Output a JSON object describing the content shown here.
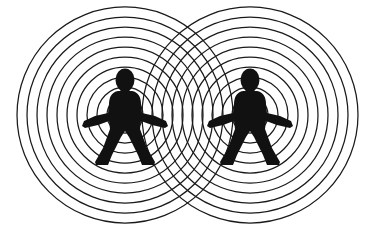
{
  "canvas": {
    "width": 375,
    "height": 241,
    "background_color": "#ffffff",
    "ink_color": "#1a1a1a"
  },
  "illustration": {
    "title": "Two-source concentric wave interference with human figures",
    "type": "line-art-diagram",
    "subject": "two people emitting concentric circular waves that overlap in the middle"
  },
  "wave_sources": [
    {
      "id": "left-source",
      "label": "left wave source",
      "center_x": 125,
      "center_y": 115,
      "ring_count": 10,
      "inner_radius": 18,
      "ring_spacing": 10,
      "outer_radius": 108,
      "stroke_color": "#1a1a1a",
      "stroke_width": 1.25
    },
    {
      "id": "right-source",
      "label": "right wave source",
      "center_x": 250,
      "center_y": 115,
      "ring_count": 10,
      "inner_radius": 18,
      "ring_spacing": 10,
      "outer_radius": 108,
      "stroke_color": "#1a1a1a",
      "stroke_width": 1.25
    }
  ],
  "figures": [
    {
      "id": "left-figure",
      "label": "left human silhouette",
      "center_x": 125,
      "center_y": 117,
      "height": 96,
      "fill_color": "#111111"
    },
    {
      "id": "right-figure",
      "label": "right human silhouette",
      "center_x": 250,
      "center_y": 117,
      "height": 96,
      "fill_color": "#111111"
    }
  ],
  "interference_zone": {
    "label": "overlap region",
    "x_start": 142,
    "x_end": 233,
    "description": "cross-hatched moire pattern where the two ring families intersect"
  }
}
